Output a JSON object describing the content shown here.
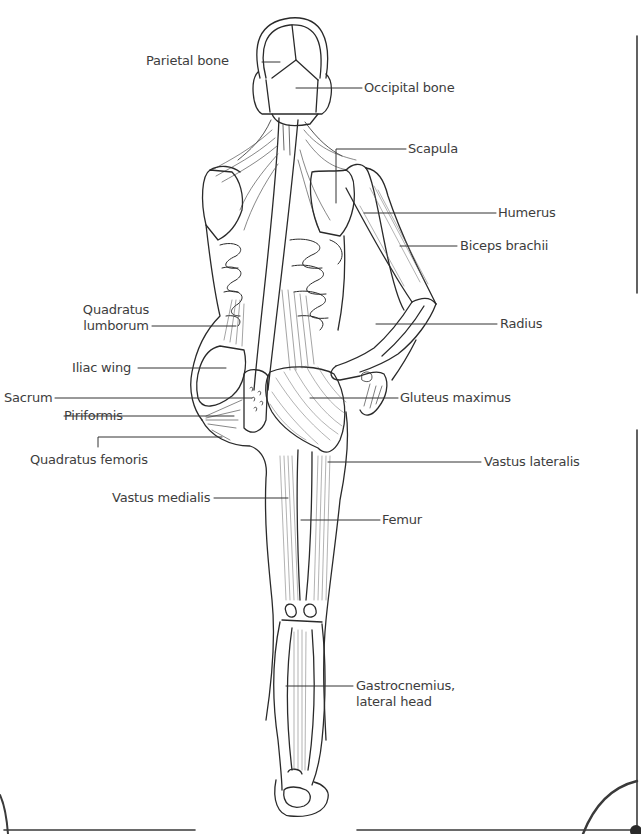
{
  "diagram": {
    "title_fragment": "",
    "view": "posterior view, human skeleton and muscles",
    "stroke_color": "#2a2a2a",
    "leader_color": "#333333",
    "frame_color": "#3a3a3a"
  },
  "labels": {
    "parietal_bone": "Parietal bone",
    "occipital_bone": "Occipital bone",
    "scapula": "Scapula",
    "humerus": "Humerus",
    "biceps_brachii": "Biceps brachii",
    "quadratus_lumborum_1": "Quadratus",
    "quadratus_lumborum_2": "lumborum",
    "radius": "Radius",
    "iliac_wing": "Iliac wing",
    "sacrum": "Sacrum",
    "gluteus_maximus": "Gluteus maximus",
    "piriformis": "Piriformis",
    "quadratus_femoris": "Quadratus femoris",
    "vastus_lateralis": "Vastus lateralis",
    "vastus_medialis": "Vastus medialis",
    "femur": "Femur",
    "gastrocnemius_1": "Gastrocnemius,",
    "gastrocnemius_2": "lateral head"
  }
}
